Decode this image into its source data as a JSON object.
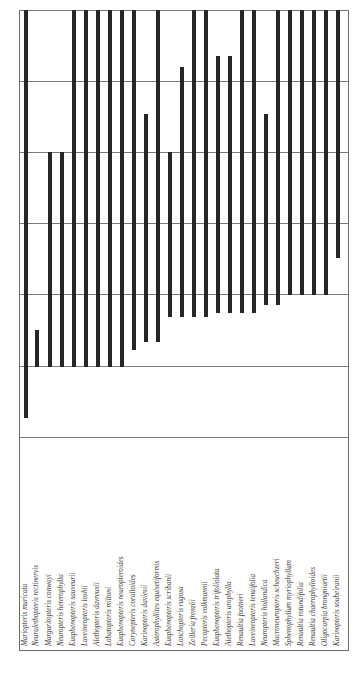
{
  "chart_data": {
    "type": "range-bar",
    "title": "",
    "xlabel": "",
    "ylabel": "",
    "orientation": "vertical bars, rotated species labels",
    "grid": true,
    "y_gridlines_px": [
      10,
      81,
      152,
      223,
      294,
      366,
      437
    ],
    "categories": [
      "Mariopteris muricata",
      "Neuralethopteris rectinervis",
      "Margaritopteris conwayi",
      "Neuropteris heterophylla",
      "Eusphenopteris sauveurii",
      "Laveineopteris loshii",
      "Alethopteris davreuxii",
      "Lobatopteris miltoni",
      "Eusphenopteris neuropteroides",
      "Corynepteris coralloides",
      "Karinopteris daviesii",
      "Asterophyllites equisetiformis",
      "Eusphenopteris scribanii",
      "Lonchopteris rugosa",
      "Zeilleria frenzlii",
      "Pecopteris volkmannii",
      "Eusphenopteris trifoliolata",
      "Alethopteris urophylla",
      "Renaultia footneri",
      "Laveineopteris tenuifolia",
      "Neuropteris hollandica",
      "Macroneuropteris scheuchzeri",
      "Sphenophyllum myriophyllum",
      "Renaultia rotundifolia",
      "Renaultia chaerophylloides",
      "Oligocarpia brongniartii",
      "Karinopteris soubeiranii"
    ],
    "bars": [
      {
        "x": 26,
        "top": 10,
        "bottom": 418
      },
      {
        "x": 37,
        "top": 330,
        "bottom": 367
      },
      {
        "x": 50,
        "top": 152,
        "bottom": 367
      },
      {
        "x": 62,
        "top": 152,
        "bottom": 367
      },
      {
        "x": 74,
        "top": 10,
        "bottom": 367
      },
      {
        "x": 86,
        "top": 10,
        "bottom": 367
      },
      {
        "x": 98,
        "top": 10,
        "bottom": 367
      },
      {
        "x": 110,
        "top": 10,
        "bottom": 367
      },
      {
        "x": 122,
        "top": 10,
        "bottom": 367
      },
      {
        "x": 134,
        "top": 10,
        "bottom": 350
      },
      {
        "x": 146,
        "top": 114,
        "bottom": 342
      },
      {
        "x": 158,
        "top": 10,
        "bottom": 342
      },
      {
        "x": 170,
        "top": 152,
        "bottom": 317
      },
      {
        "x": 182,
        "top": 67,
        "bottom": 317
      },
      {
        "x": 194,
        "top": 10,
        "bottom": 317
      },
      {
        "x": 206,
        "top": 10,
        "bottom": 317
      },
      {
        "x": 218,
        "top": 56,
        "bottom": 313
      },
      {
        "x": 230,
        "top": 56,
        "bottom": 313
      },
      {
        "x": 242,
        "top": 10,
        "bottom": 313
      },
      {
        "x": 254,
        "top": 10,
        "bottom": 313
      },
      {
        "x": 266,
        "top": 114,
        "bottom": 305
      },
      {
        "x": 278,
        "top": 10,
        "bottom": 305
      },
      {
        "x": 290,
        "top": 10,
        "bottom": 295
      },
      {
        "x": 302,
        "top": 10,
        "bottom": 295
      },
      {
        "x": 314,
        "top": 10,
        "bottom": 295
      },
      {
        "x": 326,
        "top": 10,
        "bottom": 295
      },
      {
        "x": 338,
        "top": 10,
        "bottom": 258
      }
    ],
    "legend": null
  },
  "colors": {
    "bar": "#262626",
    "grid": "#7a7a7a",
    "frame": "#6a6a6a",
    "label": "#3a3a3a"
  }
}
